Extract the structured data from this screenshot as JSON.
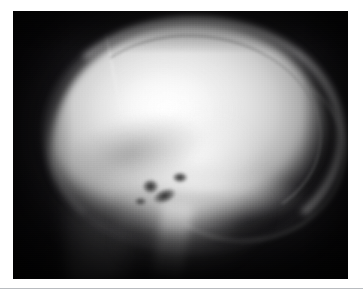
{
  "page": {
    "background_color": "#ffffff",
    "rule_color": "#b9bcc0",
    "caption": ""
  },
  "figure": {
    "name": "lateral-skull-radiograph",
    "modality": "X-ray",
    "view": "lateral",
    "body_part": "skull",
    "frame": {
      "x": 13,
      "y": 11,
      "width": 335,
      "height": 268
    },
    "film_background_color": "#060606",
    "bone_highlight_color": "#fdfdfd",
    "soft_tissue_color": "#a8a8a8",
    "regions": [
      {
        "name": "cranial-vault",
        "label": "Cranial vault"
      },
      {
        "name": "outer-table",
        "label": "Outer table of skull"
      },
      {
        "name": "inner-table",
        "label": "Inner table of skull"
      },
      {
        "name": "coronal-suture",
        "label": "Suture line"
      },
      {
        "name": "anterior-cranial-fossa",
        "label": "Anterior cranial fossa"
      },
      {
        "name": "skull-base",
        "label": "Skull base / petrous ridge"
      },
      {
        "name": "sella-lucency",
        "label": "Sella turcica lucency"
      },
      {
        "name": "mastoid-lucency",
        "label": "Mastoid air cells"
      },
      {
        "name": "facial-skeleton",
        "label": "Facial skeleton"
      },
      {
        "name": "mandibular-ramus",
        "label": "Mandibular ramus"
      },
      {
        "name": "cervical-soft-tissue",
        "label": "Cervical soft tissue"
      }
    ]
  }
}
